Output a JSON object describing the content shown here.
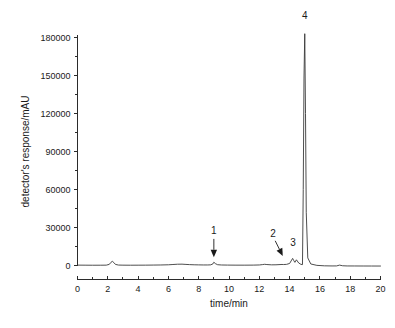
{
  "chart_data": {
    "type": "line",
    "title": "",
    "xlabel": "time/min",
    "ylabel": "detector's response/mAU",
    "xlim": [
      0,
      20
    ],
    "ylim": [
      -10000,
      190000
    ],
    "grid": false,
    "legend": "none",
    "x_ticks": [
      0,
      2,
      4,
      6,
      8,
      10,
      12,
      14,
      16,
      18,
      20
    ],
    "x_tick_labels": [
      "0",
      "2",
      "4",
      "6",
      "8",
      "10",
      "12",
      "14",
      "16",
      "18",
      "20"
    ],
    "x_minor_step": 1,
    "y_ticks": [
      0,
      30000,
      60000,
      90000,
      120000,
      150000,
      180000
    ],
    "y_tick_labels": [
      "0",
      "30000",
      "60000",
      "90000",
      "120000",
      "150000",
      "180000"
    ],
    "y_minor_step": 15000,
    "series": [
      {
        "name": "chromatogram",
        "color": "#3a3a3a",
        "x": [
          0.0,
          0.5,
          1.0,
          1.5,
          1.9,
          2.1,
          2.2,
          2.3,
          2.4,
          2.5,
          2.7,
          3.0,
          3.5,
          4.0,
          4.5,
          5.0,
          5.5,
          6.0,
          6.3,
          6.6,
          6.9,
          7.1,
          7.4,
          7.7,
          8.0,
          8.3,
          8.6,
          8.8,
          8.95,
          9.0,
          9.1,
          9.25,
          9.5,
          9.9,
          10.4,
          11.0,
          11.6,
          12.0,
          12.2,
          12.35,
          12.5,
          12.8,
          13.1,
          13.3,
          13.5,
          13.6,
          13.8,
          14.0,
          14.1,
          14.2,
          14.28,
          14.35,
          14.45,
          14.6,
          14.75,
          14.85,
          14.9,
          14.95,
          15.0,
          15.05,
          15.1,
          15.2,
          15.4,
          15.8,
          16.3,
          16.8,
          17.1,
          17.3,
          17.5,
          17.8,
          18.3,
          18.9,
          19.4,
          20.0
        ],
        "y": [
          300,
          250,
          220,
          230,
          280,
          900,
          2400,
          3300,
          2300,
          900,
          350,
          260,
          230,
          250,
          280,
          340,
          420,
          560,
          780,
          1000,
          1050,
          900,
          700,
          560,
          480,
          430,
          430,
          520,
          1400,
          2600,
          1500,
          620,
          400,
          320,
          280,
          260,
          300,
          430,
          700,
          950,
          760,
          520,
          560,
          700,
          820,
          760,
          900,
          1600,
          3600,
          5600,
          3800,
          2500,
          4500,
          2000,
          900,
          700,
          60000,
          148000,
          183000,
          120000,
          42000,
          6000,
          1200,
          100,
          -250,
          -350,
          -330,
          300,
          -200,
          -350,
          -380,
          -400,
          -420,
          -430
        ]
      }
    ],
    "annotations": [
      {
        "label": "1",
        "peak_time": 9.0,
        "label_x": 9.0,
        "label_y": 25000,
        "arrow_style": "vertical-down",
        "arrow_from_x": 9.0,
        "arrow_from_y": 21000,
        "arrow_to_x": 9.0,
        "arrow_to_y": 6500
      },
      {
        "label": "2",
        "peak_time": 13.5,
        "label_x": 12.9,
        "label_y": 22500,
        "arrow_style": "diagonal",
        "arrow_from_x": 13.05,
        "arrow_from_y": 19500,
        "arrow_to_x": 13.55,
        "arrow_to_y": 7500
      },
      {
        "label": "3",
        "peak_time": 14.2,
        "label_x": 14.22,
        "label_y": 15500,
        "arrow_style": "none"
      },
      {
        "label": "4",
        "peak_time": 15.0,
        "label_x": 15.0,
        "label_y": 195000,
        "arrow_style": "none"
      }
    ]
  }
}
